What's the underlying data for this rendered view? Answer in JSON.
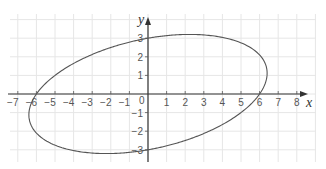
{
  "chart_data": {
    "type": "line",
    "title": "",
    "xlabel": "x",
    "ylabel": "y",
    "xlim": [
      -7.5,
      8.8
    ],
    "ylim": [
      -4,
      4
    ],
    "grid": true,
    "x_ticks": [
      -7,
      -6,
      -5,
      -4,
      -3,
      -2,
      -1,
      1,
      2,
      3,
      4,
      5,
      6,
      7,
      8
    ],
    "y_ticks": [
      -3,
      -2,
      -1,
      1,
      2,
      3
    ],
    "origin_label": "0",
    "curve": {
      "description": "Tilted ellipse x^2 - 1.4xy + 4y^2 = 36",
      "equation_coeffs": {
        "a": 1,
        "b": -1.4,
        "c": 4,
        "rhs": 36
      },
      "key_points": [
        {
          "x": -6,
          "y": 0
        },
        {
          "x": 6,
          "y": 0
        },
        {
          "x": 0,
          "y": 3
        },
        {
          "x": 0,
          "y": -3
        },
        {
          "x": 2.2,
          "y": 3.2
        },
        {
          "x": -2.2,
          "y": -3.2
        }
      ],
      "color": "#555555"
    }
  },
  "layout": {
    "origin_px": [
      148,
      94
    ],
    "unit_px": 18.6,
    "grid_px": {
      "x0": 10,
      "x1": 316,
      "y0": 14,
      "y1": 162
    }
  }
}
